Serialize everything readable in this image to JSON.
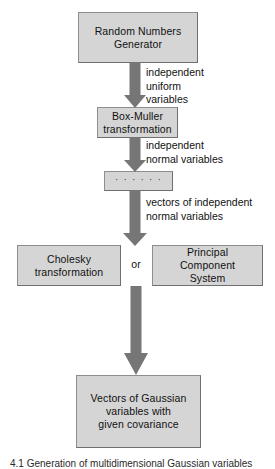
{
  "diagram": {
    "type": "flowchart",
    "orientation": "top-to-bottom",
    "nodes": [
      {
        "id": "rng",
        "label": "Random Numbers\nGenerator"
      },
      {
        "id": "boxmuller",
        "label": "Box-Muller\ntransformation"
      },
      {
        "id": "ellipsis",
        "label": "· · · · · ·"
      },
      {
        "id": "cholesky",
        "label": "Cholesky\ntransformation"
      },
      {
        "id": "pcs",
        "label": "Principal\nComponent\nSystem"
      },
      {
        "id": "gaussian",
        "label": "Vectors of Gaussian\nvariables with\ngiven covariance"
      }
    ],
    "edge_labels": [
      {
        "id": "edge1",
        "text": "independent\nuniform\nvariables"
      },
      {
        "id": "edge2",
        "text": "independent\nnormal variables"
      },
      {
        "id": "edge3",
        "text": "vectors of independent\nnormal variables"
      }
    ],
    "connector_or": "or",
    "caption": "4.1  Generation of multidimensional Gaussian variables",
    "colors": {
      "node_fill": "#d5d5d5",
      "node_border": "#8e8e8e",
      "arrow": "#767676",
      "text": "#111111",
      "background": "#ffffff"
    }
  }
}
